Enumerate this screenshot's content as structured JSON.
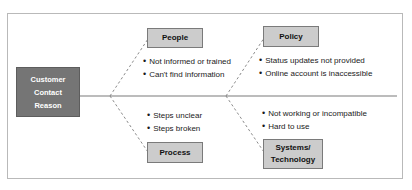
{
  "diagram": {
    "type": "fishbone-cause-and-effect",
    "effect": {
      "label_lines": [
        "Customer",
        "Contact",
        "Reason"
      ],
      "line1": "Customer",
      "line2": "Contact",
      "line3": "Reason",
      "fill_color": "#757575",
      "text_color": "#ffffff"
    },
    "category_fill_color": "#cccccc",
    "frame_color": "#b9b9b9",
    "spine_color": "#7a7a7a",
    "branch_line_style": "dashed",
    "categories": [
      {
        "id": "people",
        "label": "People",
        "position": "upper-left",
        "causes": [
          "Not informed or trained",
          "Can't find information"
        ]
      },
      {
        "id": "policy",
        "label": "Policy",
        "position": "upper-right",
        "causes": [
          "Status updates not provided",
          "Online account is inaccessible"
        ]
      },
      {
        "id": "process",
        "label": "Process",
        "position": "lower-left",
        "causes": [
          "Steps unclear",
          "Steps broken"
        ]
      },
      {
        "id": "systems",
        "label_line1": "Systems/",
        "label_line2": "Technology",
        "label": "Systems/ Technology",
        "position": "lower-right",
        "causes": [
          "Not working or incompatible",
          "Hard to use"
        ]
      }
    ],
    "bullet_glyph": "•"
  }
}
